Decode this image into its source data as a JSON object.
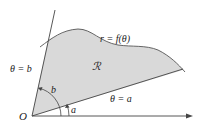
{
  "figure": {
    "type": "polar-region-diagram",
    "labels": {
      "origin": "O",
      "ray_b": "θ = b",
      "ray_a": "θ = a",
      "curve": "r = f(θ)",
      "region": "ℛ",
      "angle_b": "b",
      "angle_a": "a"
    },
    "colors": {
      "region_fill": "#d9d9d9",
      "stroke": "#444444",
      "background": "#ffffff"
    }
  }
}
